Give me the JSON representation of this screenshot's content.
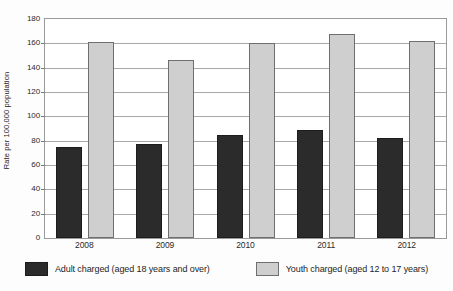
{
  "chart_data": {
    "type": "bar",
    "title": "",
    "subtitle": "",
    "xlabel": "",
    "ylabel": "Rate per 100,000 population",
    "categories": [
      "2008",
      "2009",
      "2010",
      "2011",
      "2012"
    ],
    "ylim": [
      0,
      180
    ],
    "yticks": [
      0,
      20,
      40,
      60,
      80,
      100,
      120,
      140,
      160,
      180
    ],
    "ytick_labels": [
      "0",
      "20",
      "40",
      "60",
      "80",
      "100",
      "120",
      "140",
      "160",
      "180"
    ],
    "grid": "horizontal",
    "legend_position": "bottom",
    "series": [
      {
        "name": "Adult charged (aged 18 years and over)",
        "color": "#2b2b2b",
        "values": [
          75,
          77,
          85,
          89,
          82
        ]
      },
      {
        "name": "Youth charged (aged 12 to 17 years)",
        "color": "#cfcfcf",
        "values": [
          161,
          146,
          160,
          168,
          162
        ]
      }
    ]
  }
}
